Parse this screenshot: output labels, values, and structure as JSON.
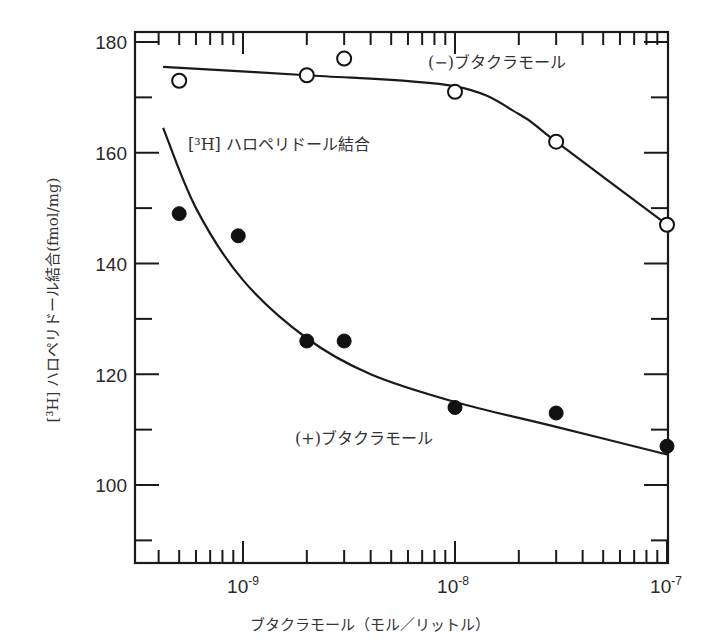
{
  "chart_data": {
    "type": "scatter",
    "title": "",
    "xlabel": "ブタクラモール（モル／リットル）",
    "ylabel": "[³H] ハロペリドール結合(fmol/mg)",
    "xscale": "log",
    "xlim": [
      3.1e-10,
      1e-07
    ],
    "ylim": [
      80,
      182
    ],
    "x_ticks": [
      "10-9",
      "10-8",
      "10-7"
    ],
    "x_tick_values": [
      1e-09,
      1e-08,
      1e-07
    ],
    "y_ticks": [
      100,
      120,
      140,
      160,
      180
    ],
    "grid": false,
    "annotations": [
      {
        "text": "[³H] ハロペリドール結合",
        "position": "upper-left"
      },
      {
        "text": "(−)ブタクラモール",
        "position": "top-right, near upper curve"
      },
      {
        "text": "(+)ブタクラモール",
        "position": "lower-middle, near lower curve"
      }
    ],
    "series": [
      {
        "name": "(−)ブタクラモール",
        "marker": "open-circle",
        "x": [
          5e-10,
          2e-09,
          3e-09,
          1e-08,
          3e-08,
          1e-07
        ],
        "y": [
          173,
          174,
          177,
          171,
          162,
          147
        ],
        "fit_curve": [
          [
            4.2e-10,
            175.5
          ],
          [
            2e-09,
            174
          ],
          [
            1e-08,
            172
          ],
          [
            2e-08,
            167
          ],
          [
            3e-08,
            162
          ],
          [
            1e-07,
            147
          ]
        ]
      },
      {
        "name": "(+)ブタクラモール",
        "marker": "filled-circle",
        "x": [
          5e-10,
          9.5e-10,
          2e-09,
          3e-09,
          1e-08,
          3e-08,
          1e-07
        ],
        "y": [
          149,
          145,
          126,
          126,
          114,
          113,
          107
        ],
        "fit_curve": [
          [
            4.2e-10,
            164.5
          ],
          [
            6e-10,
            150
          ],
          [
            1e-09,
            137
          ],
          [
            2e-09,
            126.5
          ],
          [
            4e-09,
            120
          ],
          [
            1e-08,
            115
          ],
          [
            3e-08,
            110.5
          ],
          [
            1e-07,
            105.5
          ]
        ]
      }
    ]
  },
  "labels": {
    "y_axis_title": "[³H] ハロペリドール結合(fmol/mg)",
    "x_axis_title": "ブタクラモール（モル／リットル）",
    "inner_title": "[³H] ハロペリドール結合",
    "minus_label": "(−)ブタクラモール",
    "plus_label": "(+)ブタクラモール",
    "y180": "180",
    "y160": "160",
    "y140": "140",
    "y120": "120",
    "y100": "100",
    "x_base": "10",
    "x_exp_9": "-9",
    "x_exp_8": "-8",
    "x_exp_7": "-7"
  }
}
